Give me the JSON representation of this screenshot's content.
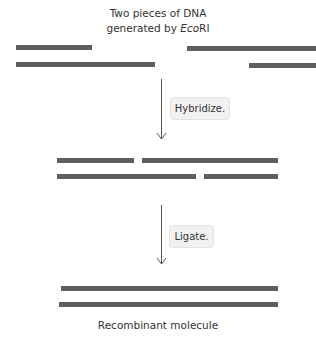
{
  "header": {
    "title_line1": "Two pieces of DNA",
    "title_line2_prefix": "generated by ",
    "title_line2_italic": "Eco",
    "title_line2_suffix": "RI"
  },
  "steps": [
    {
      "label": "Hybridize."
    },
    {
      "label": "Ligate."
    }
  ],
  "footer": {
    "caption": "Recombinant molecule"
  },
  "colors": {
    "strand": "#5e5e5e",
    "arrow": "#555555",
    "step_box": "#f1f1f1"
  },
  "stages": {
    "input_fragments": {
      "fragment_left": {
        "top_strand": [
          16,
          92
        ],
        "bottom_strand": [
          16,
          155
        ]
      },
      "fragment_right": {
        "top_strand": [
          187,
          316
        ],
        "bottom_strand": [
          249,
          316
        ]
      }
    },
    "hybridized": {
      "top_strand": [
        [
          57,
          134
        ],
        [
          142,
          278
        ]
      ],
      "bottom_strand": [
        [
          57,
          196
        ],
        [
          204,
          278
        ]
      ]
    },
    "ligated": {
      "top_strand": [
        [
          61,
          278
        ]
      ],
      "bottom_strand": [
        [
          59,
          278
        ]
      ]
    }
  }
}
